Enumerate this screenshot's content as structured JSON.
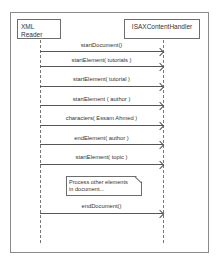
{
  "diagram": {
    "type": "sequence",
    "participants": [
      {
        "name": "XML Reader"
      },
      {
        "name": "ISAXContentHandler"
      }
    ],
    "messages": [
      {
        "label": "startDocument()",
        "from": "XML Reader",
        "to": "ISAXContentHandler"
      },
      {
        "label": "startElement( tutorials )",
        "from": "XML Reader",
        "to": "ISAXContentHandler"
      },
      {
        "label": "startElement( tutorial )",
        "from": "XML Reader",
        "to": "ISAXContentHandler"
      },
      {
        "label": "startElement ( author )",
        "from": "XML Reader",
        "to": "ISAXContentHandler"
      },
      {
        "label": "characters( Essam Ahmed )",
        "from": "XML Reader",
        "to": "ISAXContentHandler"
      },
      {
        "label": "endElement( author )",
        "from": "XML Reader",
        "to": "ISAXContentHandler"
      },
      {
        "label": "startElement( topic )",
        "from": "XML Reader",
        "to": "ISAXContentHandler"
      },
      {
        "label": "endDocument()",
        "from": "XML Reader",
        "to": "ISAXContentHandler"
      }
    ],
    "note": {
      "line1": "Process other elements",
      "line2": "in document..."
    }
  }
}
